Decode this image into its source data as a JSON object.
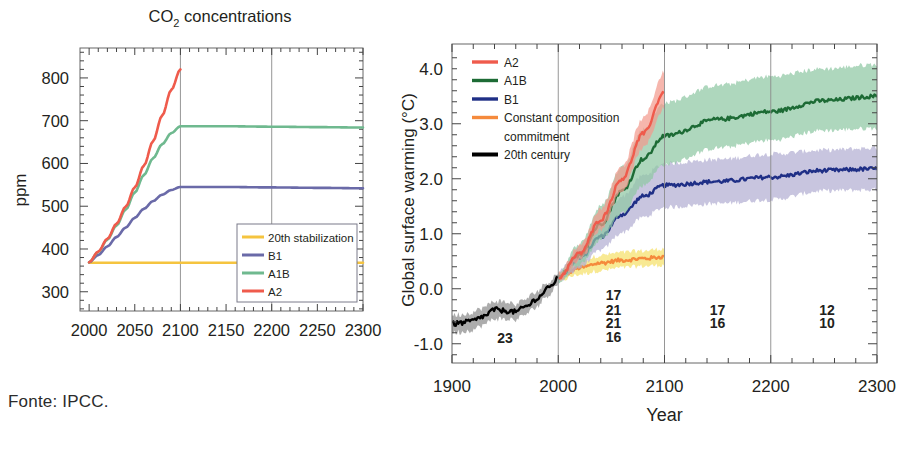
{
  "figure": {
    "caption": "Fonte: IPCC.",
    "background": "#ffffff"
  },
  "colors": {
    "a2": "#ef5b4c",
    "a1b_left": "#6fb98f",
    "a1b_right": "#1d6b35",
    "a1b_band": "#8fc7a4",
    "b1_left": "#6a6aa8",
    "b1_right": "#1f2f86",
    "b1_band": "#b3aed3",
    "stabilization": "#f5c43f",
    "constant_commitment": "#f58a3c",
    "century20": "#000000",
    "century20_band": "#8c8c8c",
    "a2_band": "#f29a8e",
    "axis": "#555555",
    "text": "#231f20"
  },
  "left_chart": {
    "title": "CO2 concentrations",
    "title_parts": {
      "main": "CO",
      "sub": "2",
      "rest": " concentrations"
    },
    "ylabel": "ppm",
    "xticks": [
      "2000",
      "2050",
      "2100",
      "2150",
      "2200",
      "2250",
      "2300"
    ],
    "yticks": [
      "300",
      "400",
      "500",
      "600",
      "700",
      "800"
    ],
    "xlim": [
      1990,
      2300
    ],
    "ylim": [
      255,
      870
    ],
    "gridlines_x": [
      2100,
      2200
    ],
    "legend": {
      "items": [
        {
          "label": "20th stabilization",
          "color": "#f5c43f"
        },
        {
          "label": "B1",
          "color": "#6a6aa8"
        },
        {
          "label": "A1B",
          "color": "#6fb98f"
        },
        {
          "label": "A2",
          "color": "#ef5b4c"
        }
      ]
    }
  },
  "right_chart": {
    "ylabel": "Global surface warming (°C)",
    "xlabel": "Year",
    "xticks": [
      "1900",
      "2000",
      "2100",
      "2200",
      "2300"
    ],
    "yticks": [
      "-1.0",
      "0.0",
      "1.0",
      "2.0",
      "3.0",
      "4.0"
    ],
    "xlim": [
      1900,
      2300
    ],
    "ylim": [
      -1.35,
      4.45
    ],
    "gridlines_x": [
      2000,
      2100,
      2200
    ],
    "legend": {
      "items": [
        {
          "label": "A2",
          "color": "#ef5b4c"
        },
        {
          "label": "A1B",
          "color": "#1d6b35"
        },
        {
          "label": "B1",
          "color": "#1f2f86"
        },
        {
          "label": "Constant composition",
          "color": "#f58a3c"
        },
        {
          "label": "commitment",
          "color": ""
        },
        {
          "label": "20th century",
          "color": "#000000"
        }
      ]
    },
    "model_counts": [
      {
        "value": "23",
        "color": "#3a3a3a",
        "x_year": 1950,
        "y_value": -0.98
      },
      {
        "value": "17",
        "color": "#ef5b4c",
        "x_year": 2052,
        "y_value": -0.2
      },
      {
        "value": "21",
        "color": "#3c8f58",
        "x_year": 2052,
        "y_value": -0.47
      },
      {
        "value": "21",
        "color": "#6a6aa8",
        "x_year": 2052,
        "y_value": -0.71
      },
      {
        "value": "16",
        "color": "#f5c43f",
        "x_year": 2052,
        "y_value": -0.96
      },
      {
        "value": "17",
        "color": "#3c8f58",
        "x_year": 2150,
        "y_value": -0.47
      },
      {
        "value": "16",
        "color": "#6a6aa8",
        "x_year": 2150,
        "y_value": -0.71
      },
      {
        "value": "12",
        "color": "#3c8f58",
        "x_year": 2253,
        "y_value": -0.47
      },
      {
        "value": "10",
        "color": "#6a6aa8",
        "x_year": 2253,
        "y_value": -0.71
      }
    ]
  },
  "chart_data": [
    {
      "type": "line",
      "id": "co2-concentrations",
      "title": "CO2 concentrations",
      "xlabel": "",
      "ylabel": "ppm",
      "xlim": [
        1990,
        2300
      ],
      "ylim": [
        255,
        870
      ],
      "xticks": [
        2000,
        2050,
        2100,
        2150,
        2200,
        2250,
        2300
      ],
      "yticks": [
        300,
        400,
        500,
        600,
        700,
        800
      ],
      "grid": "vertical-at-2100-and-2200",
      "legend_position": "lower-right",
      "series": [
        {
          "name": "20th stabilization",
          "color": "#f5c43f",
          "x": [
            2000,
            2050,
            2100,
            2150,
            2200,
            2250,
            2300
          ],
          "y": [
            368,
            368,
            368,
            368,
            368,
            368,
            368
          ]
        },
        {
          "name": "B1",
          "color": "#6a6aa8",
          "x": [
            2000,
            2010,
            2020,
            2030,
            2040,
            2050,
            2060,
            2070,
            2080,
            2090,
            2100,
            2150,
            2200,
            2250,
            2300
          ],
          "y": [
            369,
            386,
            406,
            428,
            450,
            473,
            494,
            512,
            527,
            538,
            545,
            545,
            544,
            543,
            542
          ]
        },
        {
          "name": "A1B",
          "color": "#6fb98f",
          "x": [
            2000,
            2010,
            2020,
            2030,
            2040,
            2050,
            2060,
            2070,
            2080,
            2090,
            2100,
            2150,
            2200,
            2250,
            2300
          ],
          "y": [
            369,
            393,
            422,
            455,
            492,
            532,
            573,
            612,
            645,
            671,
            687,
            687,
            686,
            685,
            684
          ]
        },
        {
          "name": "A2",
          "color": "#ef5b4c",
          "x": [
            2000,
            2010,
            2020,
            2030,
            2040,
            2050,
            2060,
            2070,
            2080,
            2090,
            2100
          ],
          "y": [
            369,
            394,
            424,
            459,
            499,
            544,
            595,
            652,
            712,
            772,
            820
          ]
        }
      ]
    },
    {
      "type": "line",
      "id": "global-surface-warming",
      "title": "",
      "xlabel": "Year",
      "ylabel": "Global surface warming (°C)",
      "xlim": [
        1900,
        2300
      ],
      "ylim": [
        -1.35,
        4.45
      ],
      "xticks": [
        1900,
        2000,
        2100,
        2200,
        2300
      ],
      "yticks": [
        -1.0,
        0.0,
        1.0,
        2.0,
        3.0,
        4.0
      ],
      "grid": "vertical-at-2000-2100-2200",
      "legend_position": "upper-left",
      "series": [
        {
          "name": "20th century",
          "color": "#000000",
          "band_color": "#8c8c8c",
          "x": [
            1900,
            1910,
            1920,
            1930,
            1940,
            1950,
            1960,
            1970,
            1980,
            1990,
            2000
          ],
          "y": [
            -0.64,
            -0.62,
            -0.58,
            -0.5,
            -0.38,
            -0.4,
            -0.42,
            -0.32,
            -0.18,
            0.0,
            0.18
          ],
          "band_low": [
            -0.8,
            -0.78,
            -0.74,
            -0.66,
            -0.54,
            -0.56,
            -0.56,
            -0.46,
            -0.32,
            -0.12,
            0.08
          ],
          "band_high": [
            -0.48,
            -0.46,
            -0.42,
            -0.34,
            -0.22,
            -0.24,
            -0.28,
            -0.18,
            -0.04,
            0.12,
            0.28
          ],
          "model_count": 23
        },
        {
          "name": "Constant composition commitment",
          "color": "#f58a3c",
          "band_color": "#f5e06a",
          "x": [
            2000,
            2020,
            2040,
            2060,
            2080,
            2100
          ],
          "y": [
            0.2,
            0.38,
            0.47,
            0.52,
            0.55,
            0.58
          ],
          "band_low": [
            0.14,
            0.26,
            0.33,
            0.38,
            0.41,
            0.43
          ],
          "band_high": [
            0.26,
            0.5,
            0.61,
            0.66,
            0.69,
            0.73
          ],
          "model_count": 16
        },
        {
          "name": "B1",
          "color": "#1f2f86",
          "band_color": "#b3aed3",
          "x": [
            2000,
            2020,
            2040,
            2060,
            2080,
            2100,
            2150,
            2200,
            2250,
            2300
          ],
          "y": [
            0.2,
            0.55,
            0.95,
            1.35,
            1.68,
            1.88,
            1.95,
            2.03,
            2.15,
            2.18
          ],
          "band_low": [
            0.12,
            0.38,
            0.7,
            1.02,
            1.3,
            1.48,
            1.55,
            1.62,
            1.78,
            1.8
          ],
          "band_high": [
            0.3,
            0.74,
            1.22,
            1.68,
            2.06,
            2.28,
            2.35,
            2.45,
            2.52,
            2.56
          ],
          "model_counts": {
            "2000_2100": 21,
            "2100_2200": 16,
            "2200_2300": 10
          }
        },
        {
          "name": "A1B",
          "color": "#1d6b35",
          "band_color": "#8fc7a4",
          "x": [
            2000,
            2020,
            2040,
            2060,
            2080,
            2100,
            2150,
            2200,
            2250,
            2300
          ],
          "y": [
            0.2,
            0.62,
            1.18,
            1.78,
            2.36,
            2.78,
            3.08,
            3.22,
            3.42,
            3.5
          ],
          "band_low": [
            0.12,
            0.44,
            0.88,
            1.38,
            1.88,
            2.26,
            2.56,
            2.7,
            2.88,
            2.92
          ],
          "band_high": [
            0.3,
            0.82,
            1.5,
            2.22,
            2.9,
            3.38,
            3.7,
            3.86,
            4.0,
            4.08
          ],
          "model_counts": {
            "2000_2100": 21,
            "2100_2200": 17,
            "2200_2300": 12
          }
        },
        {
          "name": "A2",
          "color": "#ef5b4c",
          "band_color": "#f29a8e",
          "x": [
            2000,
            2020,
            2040,
            2060,
            2080,
            2100
          ],
          "y": [
            0.2,
            0.64,
            1.26,
            2.0,
            2.82,
            3.58
          ],
          "band_low": [
            0.14,
            0.52,
            1.08,
            1.78,
            2.56,
            3.28
          ],
          "band_high": [
            0.28,
            0.78,
            1.46,
            2.24,
            3.1,
            3.94
          ],
          "model_count": 17
        }
      ]
    }
  ]
}
